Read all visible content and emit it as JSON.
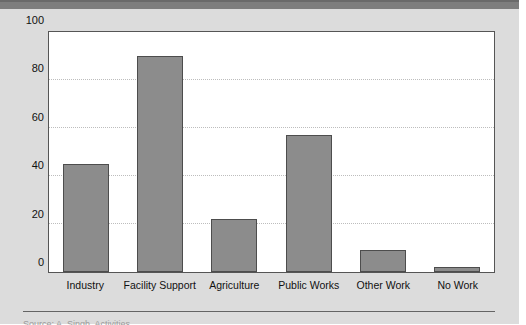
{
  "page": {
    "background_color": "#dcdcdc",
    "top_band_color": "#7e7e7e",
    "caption_text": "Source:  A. Singh, Activities"
  },
  "chart_data": {
    "type": "bar",
    "title": "",
    "subtitle": "",
    "xlabel": "",
    "ylabel": "",
    "categories": [
      "Industry",
      "Facility Support",
      "Agriculture",
      "Public Works",
      "Other Work",
      "No Work"
    ],
    "values": [
      45,
      90,
      22,
      57,
      9,
      2
    ],
    "ylim": [
      0,
      100
    ],
    "yticks": [
      0,
      20,
      40,
      60,
      80,
      100
    ],
    "ytick_labels": [
      "0",
      "20",
      "40",
      "60",
      "80",
      "100"
    ],
    "grid": true,
    "grid_axis": "y",
    "grid_style": "dotted",
    "grid_color": "#bdbdbd",
    "legend": false,
    "legend_position": "none",
    "bar_color": "#8c8c8c",
    "bar_edge_color": "#4d4d4d",
    "plot_background": "#ffffff",
    "axis_color": "#555555"
  }
}
